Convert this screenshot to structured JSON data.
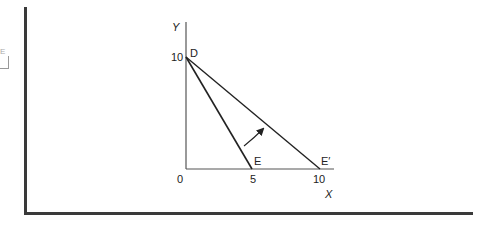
{
  "diagram": {
    "axes": {
      "y_label": "Y",
      "x_label": "X",
      "origin_label": "0",
      "y_tick": "10",
      "x_ticks": [
        "5",
        "10"
      ]
    },
    "points": {
      "D": "D",
      "E": "E",
      "E_prime": "E′"
    },
    "lines": [
      {
        "from": "D",
        "to": "E",
        "desc": "Budget line DE from (0,10) to (5,0)"
      },
      {
        "from": "D",
        "to": "E′",
        "desc": "Budget line DE′ from (0,10) to (10,0)"
      }
    ],
    "annotation": "Curved arrow indicating rotation from DE to DE′",
    "margin_mark": "E"
  }
}
